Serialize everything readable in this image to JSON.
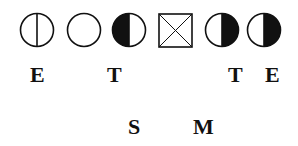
{
  "symbols": [
    {
      "name": "circle-vertical-line",
      "fill": "none"
    },
    {
      "name": "circle-empty",
      "fill": "none"
    },
    {
      "name": "circle-left-half-filled",
      "fill": "left"
    },
    {
      "name": "square-crossed",
      "fill": "none"
    },
    {
      "name": "circle-right-half-filled",
      "fill": "right"
    },
    {
      "name": "circle-right-half-filled",
      "fill": "right"
    }
  ],
  "row1_labels": [
    "E",
    "T",
    "T",
    "E"
  ],
  "row2_labels": [
    "S",
    "M"
  ],
  "colors": {
    "ink": "#111111",
    "background": "#ffffff"
  }
}
